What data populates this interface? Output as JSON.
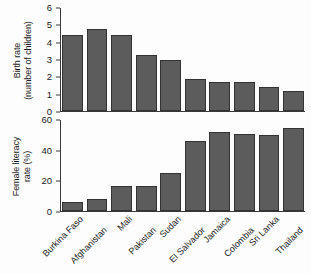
{
  "chart_data": [
    {
      "type": "bar",
      "panel": "top",
      "title": "",
      "ylabel_line1": "Birth rate",
      "ylabel_line2": "(number of children)",
      "xlabel": "",
      "ylim": [
        0,
        6
      ],
      "yticks": [
        0,
        1,
        2,
        3,
        4,
        5,
        6
      ],
      "ytick_labels": [
        "0",
        "1",
        "2",
        "3",
        "4",
        "5",
        "6"
      ],
      "grid": false,
      "legend": "none",
      "bar_color": "#5c5c5c",
      "bar_edge_color": "#333333",
      "categories": [
        "Burkina Faso",
        "Afghanistan",
        "Mali",
        "Pakistan",
        "Sudan",
        "El Salvador",
        "Jamaica",
        "Colombia",
        "Sri Lanka",
        "Thailand"
      ],
      "values": [
        4.45,
        4.8,
        4.45,
        3.25,
        3.0,
        1.85,
        1.7,
        1.7,
        1.4,
        1.15
      ]
    },
    {
      "type": "bar",
      "panel": "bottom",
      "title": "",
      "ylabel_line1": "Female literacy",
      "ylabel_line2": "rate (%)",
      "xlabel": "",
      "ylim": [
        0,
        60
      ],
      "yticks": [
        0,
        20,
        40,
        60
      ],
      "ytick_labels": [
        "0",
        "20",
        "40",
        "60"
      ],
      "grid": false,
      "legend": "none",
      "bar_color": "#5c5c5c",
      "bar_edge_color": "#333333",
      "categories": [
        "Burkina Faso",
        "Afghanistan",
        "Mali",
        "Pakistan",
        "Sudan",
        "El Salvador",
        "Jamaica",
        "Colombia",
        "Sri Lanka",
        "Thailand"
      ],
      "values": [
        6,
        8,
        16.5,
        16.5,
        25,
        46,
        52,
        51,
        50,
        55
      ]
    }
  ]
}
